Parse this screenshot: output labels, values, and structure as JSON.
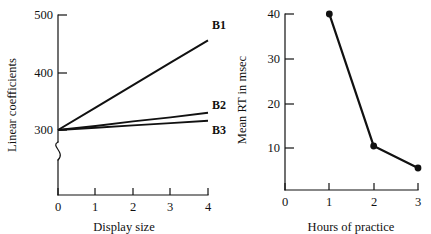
{
  "figure": {
    "background": "#ffffff",
    "ink_color": "#111111"
  },
  "chart_data": [
    {
      "id": "left",
      "type": "line",
      "title": "",
      "xlabel": "Display size",
      "ylabel": "Linear coefficients",
      "x": [
        0,
        1,
        2,
        3,
        4
      ],
      "xticklabels": [
        "0",
        "1",
        "2",
        "3",
        "4"
      ],
      "xlim": [
        0,
        4
      ],
      "yticklabels": [
        "300",
        "400",
        "500"
      ],
      "yticks": [
        300,
        400,
        500
      ],
      "ylim": [
        300,
        500
      ],
      "grid": false,
      "axis_break": true,
      "legend_position": "right-inline",
      "series": [
        {
          "name": "B1",
          "values": [
            300,
            339,
            378,
            417,
            456
          ]
        },
        {
          "name": "B2",
          "values": [
            300,
            307,
            315,
            322,
            330
          ]
        },
        {
          "name": "B3",
          "values": [
            300,
            304,
            308,
            312,
            316
          ]
        }
      ]
    },
    {
      "id": "right",
      "type": "line",
      "title": "",
      "xlabel": "Hours of practice",
      "ylabel": "Mean RT in msec",
      "x": [
        1,
        2,
        3
      ],
      "xticklabels": [
        "0",
        "1",
        "2",
        "3"
      ],
      "xticks": [
        0,
        1,
        2,
        3
      ],
      "xlim": [
        0,
        3
      ],
      "yticklabels": [
        "10",
        "20",
        "30",
        "40"
      ],
      "yticks": [
        10,
        20,
        30,
        40
      ],
      "ylim": [
        0,
        40
      ],
      "grid": false,
      "markers": true,
      "series": [
        {
          "name": "Mean RT",
          "values": [
            40,
            10,
            5
          ]
        }
      ]
    }
  ],
  "left_chart": {
    "ylabel": "Linear coefficients",
    "xlabel": "Display size",
    "yticks": [
      "500",
      "400",
      "300"
    ],
    "xticks": [
      "0",
      "1",
      "2",
      "3",
      "4"
    ],
    "series_labels": [
      "B1",
      "B2",
      "B3"
    ]
  },
  "right_chart": {
    "ylabel": "Mean RT in msec",
    "xlabel": "Hours of practice",
    "yticks": [
      "40",
      "30",
      "20",
      "10"
    ],
    "xticks": [
      "0",
      "1",
      "2",
      "3"
    ]
  }
}
